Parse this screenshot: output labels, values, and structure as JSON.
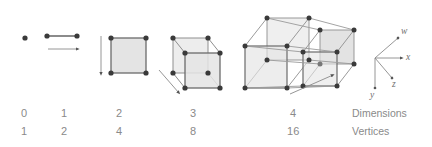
{
  "figure": {
    "colors": {
      "stroke": "#7d7d7d",
      "stroke_dark": "#5a5a5a",
      "vertex": "#3a3a3a",
      "face_fill": "#e2e2e2",
      "text": "#8a8a8a",
      "axis_text": "#6f6f6f",
      "background": "#ffffff"
    }
  },
  "columns": [
    {
      "dimensions": "0",
      "vertices": "1",
      "shape": "point"
    },
    {
      "dimensions": "1",
      "vertices": "2",
      "shape": "line-segment"
    },
    {
      "dimensions": "2",
      "vertices": "4",
      "shape": "square"
    },
    {
      "dimensions": "3",
      "vertices": "8",
      "shape": "cube"
    },
    {
      "dimensions": "4",
      "vertices": "16",
      "shape": "tesseract"
    }
  ],
  "row_labels": {
    "dimensions": "Dimensions",
    "vertices": "Vertices"
  },
  "axes": {
    "items": [
      {
        "name": "w",
        "label": "w",
        "direction": "up-right"
      },
      {
        "name": "x",
        "label": "x",
        "direction": "right"
      },
      {
        "name": "z",
        "label": "z",
        "direction": "down-right"
      },
      {
        "name": "y",
        "label": "y",
        "direction": "down"
      }
    ]
  }
}
